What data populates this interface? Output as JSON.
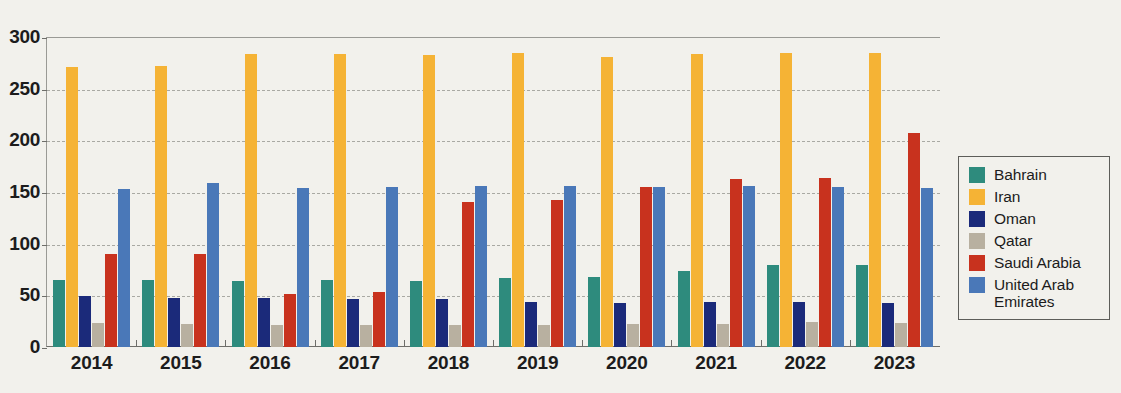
{
  "chart_data": {
    "type": "bar",
    "title": "",
    "xlabel": "",
    "ylabel": "",
    "ylim": [
      0,
      300
    ],
    "yticks": [
      0,
      50,
      100,
      150,
      200,
      250,
      300
    ],
    "grid": true,
    "legend_position": "right",
    "categories": [
      "2014",
      "2015",
      "2016",
      "2017",
      "2018",
      "2019",
      "2020",
      "2021",
      "2022",
      "2023"
    ],
    "series": [
      {
        "name": "Bahrain",
        "color": "#2e8b7d",
        "values": [
          65,
          65,
          64,
          65,
          64,
          67,
          68,
          74,
          79,
          79
        ]
      },
      {
        "name": "Iran",
        "color": "#f5b335",
        "values": [
          271,
          272,
          284,
          284,
          283,
          285,
          281,
          284,
          285,
          285
        ]
      },
      {
        "name": "Oman",
        "color": "#1b2a7a",
        "values": [
          49,
          47,
          47,
          46,
          46,
          44,
          43,
          44,
          44,
          43
        ]
      },
      {
        "name": "Qatar",
        "color": "#b8b0a0",
        "values": [
          23,
          22,
          21,
          21,
          21,
          21,
          22,
          22,
          24,
          23
        ]
      },
      {
        "name": "Saudi Arabia",
        "color": "#c8321e",
        "values": [
          90,
          90,
          51,
          53,
          140,
          142,
          155,
          163,
          164,
          207
        ]
      },
      {
        "name": "United Arab Emirates",
        "color": "#4a78b8",
        "values": [
          153,
          159,
          154,
          155,
          156,
          156,
          155,
          156,
          155,
          154
        ]
      }
    ]
  },
  "legend": {
    "items": [
      {
        "label": "Bahrain"
      },
      {
        "label": "Iran"
      },
      {
        "label": "Oman"
      },
      {
        "label": "Qatar"
      },
      {
        "label": "Saudi Arabia"
      },
      {
        "label": "United Arab\nEmirates"
      }
    ]
  },
  "axes": {
    "y_tick_labels": [
      "300",
      "250",
      "200",
      "150",
      "100",
      "50",
      "0"
    ],
    "x_tick_labels": [
      "2014",
      "2015",
      "2016",
      "2017",
      "2018",
      "2019",
      "2020",
      "2021",
      "2022",
      "2023"
    ]
  },
  "colors": {
    "background": "#f2f1ec",
    "axis": "#6e6e6a",
    "gridline": "#a9a9a3",
    "text": "#1c1c1c"
  }
}
